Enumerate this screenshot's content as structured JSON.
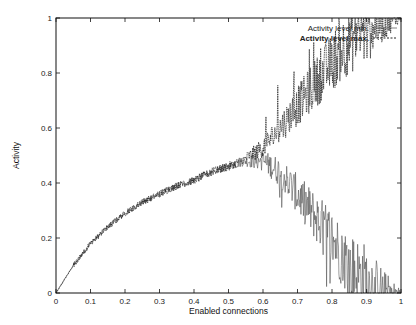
{
  "chart_data": {
    "type": "line",
    "title": "",
    "xlabel": "Enabled connections",
    "ylabel": "Activity",
    "xlim": [
      0,
      1
    ],
    "ylim": [
      0,
      1
    ],
    "xticks": [
      "0",
      "0.1",
      "0.2",
      "0.3",
      "0.4",
      "0.5",
      "0.6",
      "0.7",
      "0.8",
      "0.9",
      "1"
    ],
    "yticks": [
      "0",
      "0.2",
      "0.4",
      "0.6",
      "0.8",
      "1"
    ],
    "grid": false,
    "legend_position": "top-right",
    "series": [
      {
        "name": "Activity level min.",
        "style": "solid",
        "x": [
          0,
          0.05,
          0.1,
          0.15,
          0.2,
          0.25,
          0.3,
          0.35,
          0.4,
          0.45,
          0.5,
          0.55,
          0.6,
          0.65,
          0.7,
          0.75,
          0.8,
          0.85,
          0.9,
          0.95,
          1.0
        ],
        "values": [
          0,
          0.1,
          0.18,
          0.24,
          0.29,
          0.33,
          0.36,
          0.39,
          0.41,
          0.44,
          0.46,
          0.48,
          0.48,
          0.44,
          0.36,
          0.28,
          0.2,
          0.1,
          0.04,
          0.01,
          0
        ]
      },
      {
        "name": "Activity level max.",
        "style": "dashed",
        "x": [
          0,
          0.05,
          0.1,
          0.15,
          0.2,
          0.25,
          0.3,
          0.35,
          0.4,
          0.45,
          0.5,
          0.55,
          0.6,
          0.65,
          0.7,
          0.75,
          0.8,
          0.85,
          0.9,
          0.95,
          1.0
        ],
        "values": [
          0,
          0.1,
          0.18,
          0.24,
          0.29,
          0.33,
          0.36,
          0.39,
          0.41,
          0.44,
          0.46,
          0.49,
          0.53,
          0.6,
          0.68,
          0.76,
          0.84,
          0.92,
          0.97,
          0.99,
          1.0
        ]
      }
    ]
  },
  "legend": {
    "min_label": "Activity level min.",
    "max_label": "Activity level max."
  },
  "axes": {
    "xlabel": "Enabled connections",
    "ylabel": "Activity"
  }
}
